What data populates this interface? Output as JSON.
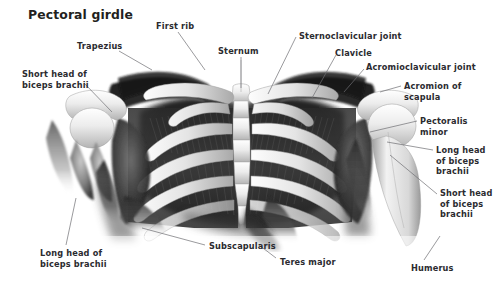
{
  "figure": {
    "title": "Pectoral girdle",
    "background_color": "#ffffff",
    "text_color": "#2b2b2f",
    "leader_line_color": "#6e6e73",
    "width": 503,
    "height": 282,
    "illustration_style": "grayscale anatomical airbrush rendering"
  },
  "labels": [
    {
      "id": "first-rib",
      "text": "First rib",
      "x": 156,
      "y": 21,
      "align": "left",
      "leader": [
        [
          178,
          32
        ],
        [
          205,
          70
        ]
      ]
    },
    {
      "id": "trapezius",
      "text": "Trapezius",
      "x": 77,
      "y": 41,
      "align": "left",
      "leader": [
        [
          119,
          51
        ],
        [
          152,
          70
        ]
      ]
    },
    {
      "id": "sternum",
      "text": "Sternum",
      "x": 218,
      "y": 46,
      "align": "left",
      "leader": [
        [
          241,
          57
        ],
        [
          241,
          88
        ]
      ]
    },
    {
      "id": "sternoclavicular-joint",
      "text": "Sternoclavicular joint",
      "x": 299,
      "y": 31,
      "align": "left",
      "leader": [
        [
          296,
          37
        ],
        [
          268,
          94
        ]
      ]
    },
    {
      "id": "clavicle",
      "text": "Clavicle",
      "x": 335,
      "y": 48,
      "align": "left",
      "leader": [
        [
          336,
          55
        ],
        [
          312,
          98
        ]
      ]
    },
    {
      "id": "acromioclavicular-joint",
      "text": "Acromioclavicular joint",
      "x": 366,
      "y": 62,
      "align": "left",
      "leader": [
        [
          364,
          69
        ],
        [
          344,
          92
        ]
      ]
    },
    {
      "id": "acromion-of-scapula",
      "text": "Acromion of\nscapula",
      "x": 404,
      "y": 81,
      "align": "left",
      "leader": [
        [
          401,
          86
        ],
        [
          380,
          92
        ]
      ]
    },
    {
      "id": "short-head-of-biceps-brachii-left",
      "text": "Short head of\nbiceps brachii",
      "x": 22,
      "y": 69,
      "align": "left",
      "leader": [
        [
          84,
          83
        ],
        [
          112,
          112
        ]
      ]
    },
    {
      "id": "pectoralis-minor",
      "text": "Pectoralis\nminor",
      "x": 420,
      "y": 116,
      "align": "left",
      "leader": [
        [
          417,
          121
        ],
        [
          370,
          132
        ]
      ]
    },
    {
      "id": "long-head-of-biceps-brachii-right",
      "text": "Long head\nof biceps\nbrachii",
      "x": 436,
      "y": 145,
      "align": "left",
      "leader": [
        [
          433,
          150
        ],
        [
          387,
          142
        ]
      ]
    },
    {
      "id": "short-head-of-biceps-brachii-right",
      "text": "Short head\nof biceps\nbrachii",
      "x": 440,
      "y": 188,
      "align": "left",
      "leader": [
        [
          437,
          194
        ],
        [
          390,
          155
        ]
      ]
    },
    {
      "id": "long-head-of-biceps-brachii-left",
      "text": "Long head of\nbiceps brachii",
      "x": 40,
      "y": 248,
      "align": "left",
      "leader": [
        [
          66,
          245
        ],
        [
          76,
          198
        ]
      ]
    },
    {
      "id": "subscapularis",
      "text": "Subscapularis",
      "x": 209,
      "y": 241,
      "align": "left",
      "leader": [
        [
          205,
          245
        ],
        [
          142,
          228
        ]
      ]
    },
    {
      "id": "teres-major",
      "text": "Teres major",
      "x": 280,
      "y": 257,
      "align": "left",
      "leader": [
        [
          276,
          258
        ],
        [
          259,
          245
        ]
      ]
    },
    {
      "id": "humerus",
      "text": "Humerus",
      "x": 411,
      "y": 263,
      "align": "left",
      "leader": [
        [
          424,
          260
        ],
        [
          440,
          236
        ]
      ]
    }
  ]
}
